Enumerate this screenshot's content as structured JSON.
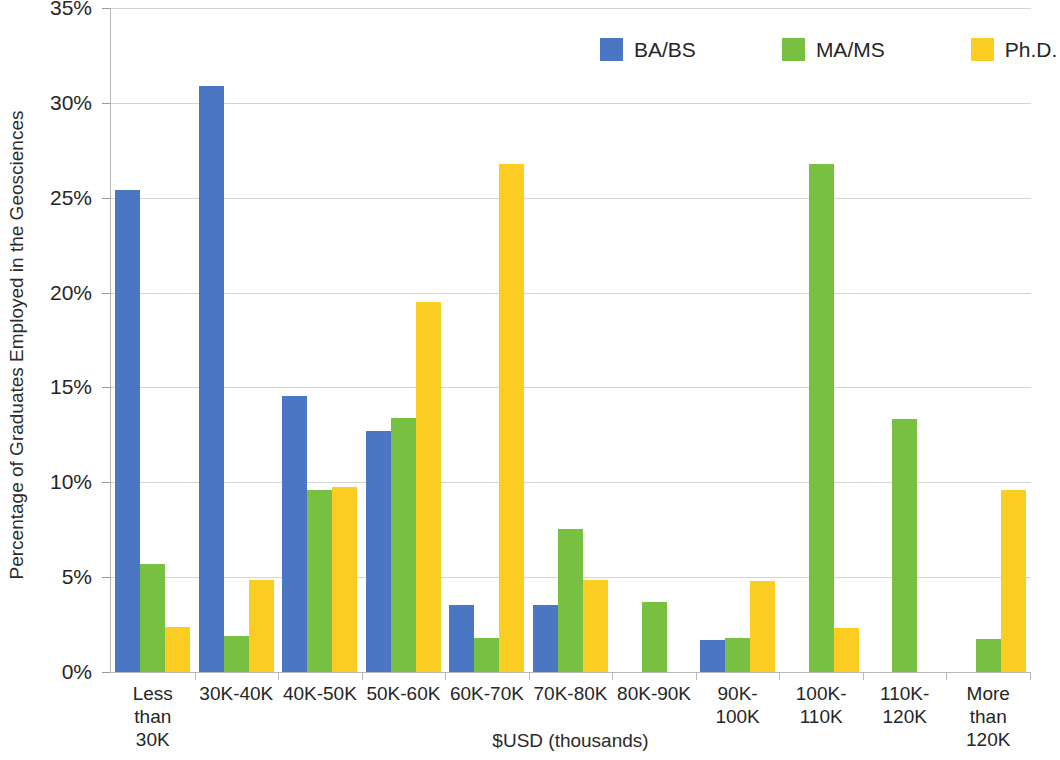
{
  "chart_data": {
    "type": "bar",
    "title": "",
    "xlabel": "$USD (thousands)",
    "ylabel": "Percentage of Graduates Employed in the Geosciences",
    "ylim": [
      0,
      35
    ],
    "ytick_values": [
      0,
      5,
      10,
      15,
      20,
      25,
      30,
      35
    ],
    "ytick_labels": [
      "0%",
      "5%",
      "10%",
      "15%",
      "20%",
      "25%",
      "30%",
      "35%"
    ],
    "grid": true,
    "legend_position": "top-right",
    "categories": [
      "Less than 30K",
      "30K-40K",
      "40K-50K",
      "50K-60K",
      "60K-70K",
      "70K-80K",
      "80K-90K",
      "90K-100K",
      "100K-110K",
      "110K-120K",
      "More than 120K"
    ],
    "category_labels": [
      [
        "Less than",
        "30K"
      ],
      [
        "30K-40K"
      ],
      [
        "40K-50K"
      ],
      [
        "50K-60K"
      ],
      [
        "60K-70K"
      ],
      [
        "70K-80K"
      ],
      [
        "80K-90K"
      ],
      [
        "90K-",
        "100K"
      ],
      [
        "100K-",
        "110K"
      ],
      [
        "110K-",
        "120K"
      ],
      [
        "More than",
        "120K"
      ]
    ],
    "series": [
      {
        "name": "BA/BS",
        "color": "#4a76c4",
        "values": [
          25.4,
          30.9,
          14.55,
          12.7,
          3.55,
          3.55,
          0,
          1.7,
          0,
          0,
          0
        ]
      },
      {
        "name": "MA/MS",
        "color": "#77c042",
        "values": [
          5.7,
          1.9,
          9.6,
          13.4,
          1.8,
          7.55,
          3.7,
          1.8,
          26.8,
          13.35,
          1.75
        ]
      },
      {
        "name": "Ph.D.",
        "color": "#fbcd23",
        "values": [
          2.35,
          4.85,
          9.75,
          19.5,
          26.8,
          4.85,
          0,
          4.8,
          2.3,
          0,
          9.6
        ]
      }
    ]
  },
  "legend": {
    "items": [
      {
        "label": "BA/BS",
        "color": "#4a76c4"
      },
      {
        "label": "MA/MS",
        "color": "#77c042"
      },
      {
        "label": "Ph.D.",
        "color": "#fbcd23"
      }
    ]
  },
  "axes": {
    "y_title": "Percentage of Graduates Employed in the Geosciences",
    "x_title": "$USD (thousands)"
  },
  "colors": {
    "gridline": "#d4d4d4",
    "axis": "#b8b8b8",
    "text": "#262626",
    "background": "#ffffff"
  }
}
